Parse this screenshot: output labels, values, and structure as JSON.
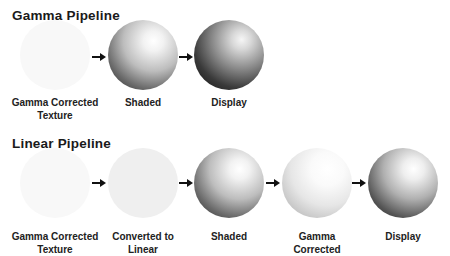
{
  "gamma_pipeline": {
    "title": "Gamma Pipeline",
    "steps": [
      {
        "label_line1": "Gamma Corrected",
        "label_line2": "Texture",
        "appearance": "flat-white"
      },
      {
        "label_line1": "Shaded",
        "label_line2": "",
        "appearance": "shaded-sphere"
      },
      {
        "label_line1": "Display",
        "label_line2": "",
        "appearance": "dark-sphere"
      }
    ],
    "arrow_icon": "right-arrow-icon"
  },
  "linear_pipeline": {
    "title": "Linear Pipeline",
    "steps": [
      {
        "label_line1": "Gamma Corrected",
        "label_line2": "Texture",
        "appearance": "flat-white"
      },
      {
        "label_line1": "Converted to",
        "label_line2": "Linear",
        "appearance": "flat-light-gray"
      },
      {
        "label_line1": "Shaded",
        "label_line2": "",
        "appearance": "shaded-sphere"
      },
      {
        "label_line1": "Gamma",
        "label_line2": "Corrected",
        "appearance": "bright-sphere"
      },
      {
        "label_line1": "Display",
        "label_line2": "",
        "appearance": "shaded-sphere"
      }
    ],
    "arrow_icon": "right-arrow-icon"
  }
}
